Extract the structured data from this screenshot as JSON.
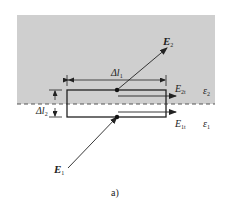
{
  "figure": {
    "caption": "a)",
    "colors": {
      "medium2_fill": "#cfcfcf",
      "line": "#222222",
      "dashed_boundary": "#555555",
      "background": "#ffffff"
    },
    "regions": [
      {
        "name": "medium-2",
        "permittivity_symbol": "ε",
        "permittivity_sub": "2",
        "shaded": true
      },
      {
        "name": "medium-1",
        "permittivity_symbol": "ε",
        "permittivity_sub": "1",
        "shaded": false
      }
    ],
    "vectors": {
      "E2": {
        "symbol": "E",
        "sub": "2"
      },
      "E1": {
        "symbol": "E",
        "sub": "1"
      },
      "E2t": {
        "symbol": "E",
        "sub": "2t"
      },
      "E1t": {
        "symbol": "E",
        "sub": "1t"
      }
    },
    "dimensions": {
      "dl1": {
        "symbol": "Δl",
        "sub": "1"
      },
      "dl2": {
        "symbol": "Δl",
        "sub": "2"
      }
    }
  }
}
